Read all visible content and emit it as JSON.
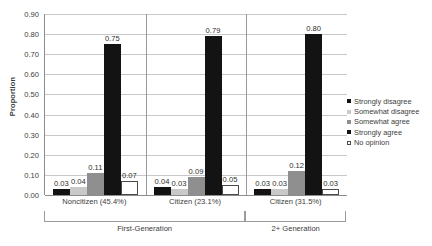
{
  "chart_data": {
    "type": "bar",
    "title": "",
    "xlabel": "",
    "ylabel": "Proportion",
    "ylim": [
      0.0,
      0.9
    ],
    "ytick_step": 0.1,
    "yticks": [
      "0.90",
      "0.80",
      "0.70",
      "0.60",
      "0.50",
      "0.40",
      "0.30",
      "0.20",
      "0.10",
      "0.00"
    ],
    "grid": true,
    "legend_position": "right",
    "categories": [
      "Noncitizen (45.4%)",
      "Citizen (23.1%)",
      "Citizen (31.5%)"
    ],
    "group_labels": [
      {
        "label": "First-Generation",
        "categories": [
          "Noncitizen (45.4%)",
          "Citizen (23.1%)"
        ]
      },
      {
        "label": "2+ Generation",
        "categories": [
          "Citizen (31.5%)"
        ]
      }
    ],
    "series": [
      {
        "name": "Strongly disagree",
        "color": "#131313",
        "values": [
          0.03,
          0.04,
          0.03
        ],
        "labels": [
          "0.03",
          "0.04",
          "0.03"
        ]
      },
      {
        "name": "Somewhat disagree",
        "color": "#c9c9c9",
        "values": [
          0.04,
          0.03,
          0.03
        ],
        "labels": [
          "0.04",
          "0.03",
          "0.03"
        ]
      },
      {
        "name": "Somewhat agree",
        "color": "#8f8f8f",
        "values": [
          0.11,
          0.09,
          0.12
        ],
        "labels": [
          "0.11",
          "0.09",
          "0.12"
        ]
      },
      {
        "name": "Strongly agree",
        "color": "#131313",
        "values": [
          0.75,
          0.79,
          0.8
        ],
        "labels": [
          "0.75",
          "0.79",
          "0.80"
        ]
      },
      {
        "name": "No opinion",
        "color": "#ffffff",
        "values": [
          0.07,
          0.05,
          0.03
        ],
        "labels": [
          "0.07",
          "0.05",
          "0.03"
        ]
      }
    ]
  },
  "axis": {
    "y_title": "Proportion"
  },
  "legend": {
    "items": [
      {
        "label": "Strongly disagree"
      },
      {
        "label": "Somewhat disagree"
      },
      {
        "label": "Somewhat agree"
      },
      {
        "label": "Strongly agree"
      },
      {
        "label": "No opinion"
      }
    ]
  }
}
